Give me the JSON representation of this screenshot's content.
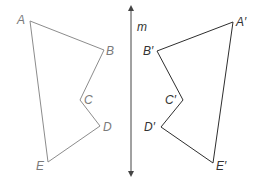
{
  "diagram": {
    "type": "reflection",
    "line": {
      "name": "m",
      "label": "m"
    },
    "colors": {
      "preimage": "#8c8c8c",
      "image": "#2e2e2e",
      "axis": "#444444",
      "preimage_label": "#7a7a7a",
      "image_label": "#333333"
    },
    "preimage": {
      "vertices": [
        {
          "name": "A",
          "label": "A"
        },
        {
          "name": "B",
          "label": "B"
        },
        {
          "name": "C",
          "label": "C"
        },
        {
          "name": "D",
          "label": "D"
        },
        {
          "name": "E",
          "label": "E"
        }
      ]
    },
    "image": {
      "vertices": [
        {
          "name": "A'",
          "label": "A′"
        },
        {
          "name": "B'",
          "label": "B′"
        },
        {
          "name": "C'",
          "label": "C′"
        },
        {
          "name": "D'",
          "label": "D′"
        },
        {
          "name": "E'",
          "label": "E′"
        }
      ]
    }
  }
}
